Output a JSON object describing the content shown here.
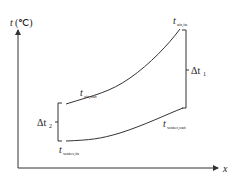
{
  "diagram": {
    "axes": {
      "y_label_main": "t",
      "y_label_unit": "(℃)",
      "x_label": "x"
    },
    "curves": [
      {
        "name": "air",
        "label_main": "t",
        "label_sub_in": "air,in",
        "label_sub_out": "air,out"
      },
      {
        "name": "water",
        "label_main": "t",
        "label_sub_in": "water,in",
        "label_sub_out": "water,out"
      }
    ],
    "differences": {
      "delta1_main": "Δt",
      "delta1_sub": "1",
      "delta2_main": "Δt",
      "delta2_sub": "2"
    },
    "colors": {
      "line": "#333333",
      "text": "#222222",
      "background": "#ffffff"
    }
  }
}
